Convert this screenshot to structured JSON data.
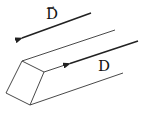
{
  "diagram": {
    "labels": {
      "vector": "D",
      "vector_arrow": "→",
      "magnitude": "D"
    },
    "colors": {
      "stroke": "#222222",
      "background": "#ffffff"
    }
  }
}
